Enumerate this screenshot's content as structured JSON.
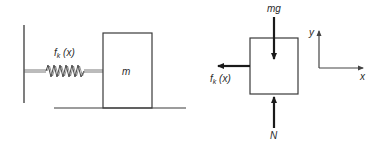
{
  "system_diagram": {
    "spring_label": "f",
    "spring_label_sub": "k",
    "spring_label_arg": " (x)",
    "mass_label": "m"
  },
  "free_body_diagram": {
    "weight_label": "mg",
    "normal_label": "N",
    "friction_label": "f",
    "friction_label_sub": "k",
    "friction_label_arg": " (x)"
  },
  "axes": {
    "x_label": "x",
    "y_label": "y"
  },
  "colors": {
    "stroke": "#3a3a3a",
    "arrow": "#1a1a1a",
    "text": "#2a2a2a",
    "background": "#ffffff"
  }
}
